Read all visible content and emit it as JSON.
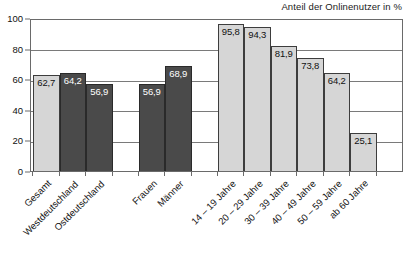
{
  "chart_data": {
    "type": "bar",
    "title": "Anteil der Onlinenutzer in %",
    "xlabel": "",
    "ylabel": "",
    "ylim": [
      0,
      100
    ],
    "yticks": [
      0,
      20,
      40,
      60,
      80,
      100
    ],
    "grid": true,
    "legend": "none",
    "value_format": "german-decimal-comma",
    "categories": [
      "Gesamt",
      "Westdeutschland",
      "Ostdeutschland",
      "Frauen",
      "Männer",
      "14 – 19 Jahre",
      "20 – 29 Jahre",
      "30 – 39 Jahre",
      "40 – 49 Jahre",
      "50 – 59 Jahre",
      "ab 60 Jahre"
    ],
    "values": [
      62.7,
      64.2,
      56.9,
      56.9,
      68.9,
      95.8,
      94.3,
      81.9,
      73.8,
      64.2,
      25.1
    ],
    "value_labels": [
      "62,7",
      "64,2",
      "56,9",
      "56,9",
      "68,9",
      "95,8",
      "94,3",
      "81,9",
      "73,8",
      "64,2",
      "25,1"
    ],
    "bar_styles": [
      "light",
      "dark",
      "dark",
      "dark",
      "dark",
      "light",
      "light",
      "light",
      "light",
      "light",
      "light"
    ],
    "groups": [
      {
        "name": "Gesamt / Region",
        "indices": [
          0,
          1,
          2
        ]
      },
      {
        "name": "Geschlecht",
        "indices": [
          3,
          4
        ]
      },
      {
        "name": "Altersgruppen",
        "indices": [
          5,
          6,
          7,
          8,
          9,
          10
        ]
      }
    ],
    "colors": {
      "bar_light": "#d6d6d6",
      "bar_dark": "#4a4a4a",
      "bar_outline": "#3d3d3d",
      "grid": "#7a7a7a",
      "axis": "#6a6a6a",
      "text": "#111111",
      "label_on_dark": "#ffffff"
    }
  },
  "ytick_labels": [
    "100",
    "80",
    "60",
    "40",
    "20",
    "0"
  ]
}
